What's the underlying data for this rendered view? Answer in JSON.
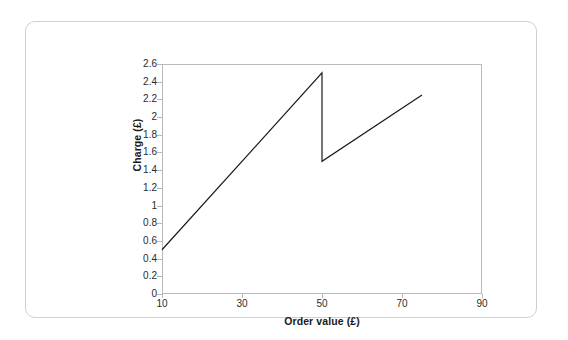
{
  "chart_data": {
    "type": "line",
    "title": "",
    "subtitle": "",
    "xlabel": "Order value (£)",
    "ylabel": "Charge (£)",
    "xlim": [
      10,
      90
    ],
    "ylim": [
      0,
      2.6
    ],
    "xticks": [
      10,
      30,
      50,
      70,
      90
    ],
    "xtick_labels": [
      "10",
      "30",
      "50",
      "70",
      "90"
    ],
    "yticks": [
      0,
      0.2,
      0.4,
      0.6,
      0.8,
      1,
      1.2,
      1.4,
      1.6,
      1.8,
      2,
      2.2,
      2.4,
      2.6
    ],
    "ytick_labels": [
      "0",
      "0.2",
      "0.4",
      "0.6",
      "0.8",
      "1",
      "1.2",
      "1.4",
      "1.6",
      "1.8",
      "2",
      "2.2",
      "2.4",
      "2.6"
    ],
    "grid": false,
    "legend": null,
    "legend_position": "none",
    "line_color": "#1a1a1a",
    "series": [
      {
        "name": "Charge",
        "segments": [
          {
            "name": "lower-band-segment",
            "points": [
              [
                10,
                0.5
              ],
              [
                50,
                2.5
              ]
            ]
          },
          {
            "name": "discontinuity-drop",
            "points": [
              [
                50,
                2.5
              ],
              [
                50,
                1.5
              ]
            ]
          },
          {
            "name": "upper-band-segment",
            "points": [
              [
                50,
                1.5
              ],
              [
                75,
                2.25
              ]
            ]
          }
        ]
      }
    ],
    "annotations": []
  },
  "figure": {
    "border_color": "#cfcfcf",
    "background_color": "#ffffff",
    "plot_frame_color": "#b9b9b9"
  }
}
